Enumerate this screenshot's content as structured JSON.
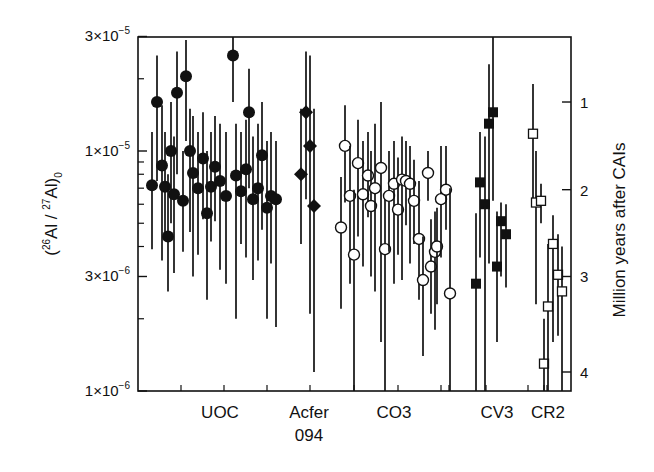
{
  "chart_data": {
    "type": "scatter",
    "title": "",
    "ylabel": "(26Al / 27Al)0",
    "ylabel_parts": {
      "open": "(",
      "sup1": "26",
      "mid": "Al / ",
      "sup2": "27",
      "end": "Al)",
      "sub": "0"
    },
    "y2label": "Million years after CAIs",
    "yscale": "log",
    "ylim": [
      1e-06,
      3e-05
    ],
    "y_ticks": [
      {
        "value": 3e-05,
        "label_base": "3×10",
        "label_exp": "−5"
      },
      {
        "value": 1e-05,
        "label_base": "1×10",
        "label_exp": "−5"
      },
      {
        "value": 3e-06,
        "label_base": "3×10",
        "label_exp": "−6"
      },
      {
        "value": 1e-06,
        "label_base": "1×10",
        "label_exp": "−6"
      }
    ],
    "y2_ticks": [
      {
        "label": "1",
        "value": 1.6e-05
      },
      {
        "label": "2",
        "value": 6.9e-06
      },
      {
        "label": "3",
        "value": 3e-06
      },
      {
        "label": "4",
        "value": 1.2e-06
      }
    ],
    "categories": [
      {
        "label": "UOC",
        "line2": ""
      },
      {
        "label": "Acfer",
        "line2": "094"
      },
      {
        "label": "CO3",
        "line2": ""
      },
      {
        "label": "CV3",
        "line2": ""
      },
      {
        "label": "CR2",
        "line2": ""
      }
    ],
    "grid": false,
    "legend": "none",
    "series": [
      {
        "name": "UOC",
        "marker": "filled-circle",
        "points": [
          {
            "x": 152,
            "y": 7.2e-06,
            "lo": 3.9e-06,
            "hi": 1.2e-05
          },
          {
            "x": 157,
            "y": 1.6e-05,
            "lo": 7.5e-06,
            "hi": 2.5e-05
          },
          {
            "x": 162,
            "y": 8.7e-06,
            "lo": 3.5e-06,
            "hi": 1.55e-05
          },
          {
            "x": 165,
            "y": 7.1e-06,
            "lo": 4.3e-06,
            "hi": 1.2e-05
          },
          {
            "x": 168,
            "y": 4.4e-06,
            "lo": 2.6e-06,
            "hi": 8e-06
          },
          {
            "x": 171,
            "y": 1e-05,
            "lo": 5e-06,
            "hi": 1.6e-05
          },
          {
            "x": 174,
            "y": 6.6e-06,
            "lo": 3.1e-06,
            "hi": 1.15e-05
          },
          {
            "x": 177,
            "y": 1.75e-05,
            "lo": 8e-06,
            "hi": 2.6e-05
          },
          {
            "x": 183,
            "y": 6.2e-06,
            "lo": 3.8e-06,
            "hi": 1e-05
          },
          {
            "x": 186,
            "y": 2.05e-05,
            "lo": 1.1e-05,
            "hi": 2.9e-05
          },
          {
            "x": 190,
            "y": 1e-05,
            "lo": 4.6e-06,
            "hi": 1.5e-05
          },
          {
            "x": 193,
            "y": 8.1e-06,
            "lo": 3e-06,
            "hi": 1.4e-05
          },
          {
            "x": 198,
            "y": 7e-06,
            "lo": 3.7e-06,
            "hi": 1.2e-05
          },
          {
            "x": 203,
            "y": 9.3e-06,
            "lo": 5.2e-06,
            "hi": 1.45e-05
          },
          {
            "x": 207,
            "y": 5.5e-06,
            "lo": 2.4e-06,
            "hi": 1e-05
          },
          {
            "x": 211,
            "y": 7.1e-06,
            "lo": 4.2e-06,
            "hi": 1.2e-05
          },
          {
            "x": 215,
            "y": 8.6e-06,
            "lo": 5.1e-06,
            "hi": 1.4e-05
          },
          {
            "x": 220,
            "y": 7.5e-06,
            "lo": 3.2e-06,
            "hi": 1.3e-05
          },
          {
            "x": 233,
            "y": 2.5e-05,
            "lo": 1.6e-05,
            "hi": 3e-05
          },
          {
            "x": 226,
            "y": 6.5e-06,
            "lo": 2.8e-06,
            "hi": 1.2e-05
          },
          {
            "x": 236,
            "y": 7.9e-06,
            "lo": 2e-06,
            "hi": 1.3e-05
          },
          {
            "x": 241,
            "y": 6.8e-06,
            "lo": 4.1e-06,
            "hi": 1.2e-05
          },
          {
            "x": 246,
            "y": 8.4e-06,
            "lo": 3.6e-06,
            "hi": 1.35e-05
          },
          {
            "x": 249,
            "y": 1.45e-05,
            "lo": 7e-06,
            "hi": 2.2e-05
          },
          {
            "x": 253,
            "y": 6.3e-06,
            "lo": 2.9e-06,
            "hi": 1.15e-05
          },
          {
            "x": 258,
            "y": 7e-06,
            "lo": 3.5e-06,
            "hi": 1.3e-05
          },
          {
            "x": 262,
            "y": 9.6e-06,
            "lo": 4.7e-06,
            "hi": 1.6e-05
          },
          {
            "x": 267,
            "y": 5.8e-06,
            "lo": 2e-06,
            "hi": 1.1e-05
          },
          {
            "x": 271,
            "y": 6.5e-06,
            "lo": 3.4e-06,
            "hi": 1.2e-05
          },
          {
            "x": 276,
            "y": 6.3e-06,
            "lo": 1.85e-06,
            "hi": 1.1e-05
          }
        ]
      },
      {
        "name": "Acfer 094",
        "marker": "filled-diamond",
        "points": [
          {
            "x": 301,
            "y": 8e-06,
            "lo": 4.1e-06,
            "hi": 1.5e-05
          },
          {
            "x": 306,
            "y": 1.45e-05,
            "lo": 6.3e-06,
            "hi": 2.6e-05
          },
          {
            "x": 310,
            "y": 1.05e-05,
            "lo": 2.1e-06,
            "hi": 2.5e-05
          },
          {
            "x": 314,
            "y": 5.9e-06,
            "lo": 1.2e-06,
            "hi": 1.5e-05
          }
        ]
      },
      {
        "name": "CO3",
        "marker": "open-circle",
        "points": [
          {
            "x": 341,
            "y": 4.8e-06,
            "lo": 2.2e-06,
            "hi": 7.8e-06
          },
          {
            "x": 345,
            "y": 1.05e-05,
            "lo": 6.1e-06,
            "hi": 1.55e-05
          },
          {
            "x": 350,
            "y": 6.5e-06,
            "lo": 2.8e-06,
            "hi": 1.05e-05
          },
          {
            "x": 354,
            "y": 3.7e-06,
            "lo": 1e-06,
            "hi": 6.9e-06
          },
          {
            "x": 358,
            "y": 8.9e-06,
            "lo": 4.4e-06,
            "hi": 1.35e-05
          },
          {
            "x": 363,
            "y": 6.6e-06,
            "lo": 3.3e-06,
            "hi": 1.1e-05
          },
          {
            "x": 368,
            "y": 7.9e-06,
            "lo": 5.3e-06,
            "hi": 1.2e-05
          },
          {
            "x": 371,
            "y": 5.9e-06,
            "lo": 3e-06,
            "hi": 1e-05
          },
          {
            "x": 375,
            "y": 7e-06,
            "lo": 2.6e-06,
            "hi": 1.3e-05
          },
          {
            "x": 381,
            "y": 8.5e-06,
            "lo": 1.6e-06,
            "hi": 1.6e-05
          },
          {
            "x": 385,
            "y": 3.9e-06,
            "lo": 1e-06,
            "hi": 6.7e-06
          },
          {
            "x": 389,
            "y": 6.5e-06,
            "lo": 3.8e-06,
            "hi": 1e-05
          },
          {
            "x": 394,
            "y": 7.3e-06,
            "lo": 2.8e-06,
            "hi": 1.1e-05
          },
          {
            "x": 398,
            "y": 5.7e-06,
            "lo": 3.7e-06,
            "hi": 9.4e-06
          },
          {
            "x": 402,
            "y": 7.6e-06,
            "lo": 2.9e-06,
            "hi": 1.15e-05
          },
          {
            "x": 406,
            "y": 7.5e-06,
            "lo": 4.9e-06,
            "hi": 1.1e-05
          },
          {
            "x": 410,
            "y": 7.3e-06,
            "lo": 3.4e-06,
            "hi": 1.05e-05
          },
          {
            "x": 414,
            "y": 6.2e-06,
            "lo": 4.1e-06,
            "hi": 9.2e-06
          },
          {
            "x": 419,
            "y": 4.3e-06,
            "lo": 2.4e-06,
            "hi": 7.5e-06
          },
          {
            "x": 423,
            "y": 2.9e-06,
            "lo": 1.4e-06,
            "hi": 4.4e-06
          },
          {
            "x": 428,
            "y": 8.1e-06,
            "lo": 6.2e-06,
            "hi": 1e-05
          },
          {
            "x": 431,
            "y": 3.3e-06,
            "lo": 2.1e-06,
            "hi": 5.2e-06
          },
          {
            "x": 435,
            "y": 3.8e-06,
            "lo": 1.8e-06,
            "hi": 5.6e-06
          },
          {
            "x": 437,
            "y": 4e-06,
            "lo": 2.3e-06,
            "hi": 5.8e-06
          },
          {
            "x": 441,
            "y": 6.3e-06,
            "lo": 3.6e-06,
            "hi": 1.05e-05
          },
          {
            "x": 446,
            "y": 6.9e-06,
            "lo": 4.7e-06,
            "hi": 1.05e-05
          },
          {
            "x": 450,
            "y": 2.55e-06,
            "lo": 1e-06,
            "hi": 7e-06
          }
        ]
      },
      {
        "name": "CV3",
        "marker": "filled-square",
        "points": [
          {
            "x": 476,
            "y": 2.8e-06,
            "lo": 1e-06,
            "hi": 5.5e-06
          },
          {
            "x": 480,
            "y": 7.4e-06,
            "lo": 3.6e-06,
            "hi": 1.2e-05
          },
          {
            "x": 485,
            "y": 6e-06,
            "lo": 1e-06,
            "hi": 1.15e-05
          },
          {
            "x": 489,
            "y": 1.3e-05,
            "lo": 3.4e-06,
            "hi": 2.3e-05
          },
          {
            "x": 493,
            "y": 1.45e-05,
            "lo": 6.2e-06,
            "hi": 3e-05
          },
          {
            "x": 497,
            "y": 3.3e-06,
            "lo": 1.6e-06,
            "hi": 5.6e-06
          },
          {
            "x": 501,
            "y": 5.1e-06,
            "lo": 3e-06,
            "hi": 6.1e-06
          },
          {
            "x": 506,
            "y": 4.5e-06,
            "lo": 2.7e-06,
            "hi": 6e-06
          }
        ]
      },
      {
        "name": "CR2",
        "marker": "open-square",
        "points": [
          {
            "x": 533,
            "y": 1.18e-05,
            "lo": 6e-06,
            "hi": 1.9e-05
          },
          {
            "x": 536,
            "y": 6.1e-06,
            "lo": 2.3e-06,
            "hi": 1e-05
          },
          {
            "x": 541,
            "y": 6.2e-06,
            "lo": 5e-06,
            "hi": 7.3e-06
          },
          {
            "x": 544,
            "y": 1.3e-06,
            "lo": 1e-06,
            "hi": 2e-06
          },
          {
            "x": 548,
            "y": 2.25e-06,
            "lo": 1e-06,
            "hi": 4.1e-06
          },
          {
            "x": 553,
            "y": 4.1e-06,
            "lo": 1.6e-06,
            "hi": 5.4e-06
          },
          {
            "x": 558,
            "y": 3.05e-06,
            "lo": 1.7e-06,
            "hi": 4.5e-06
          },
          {
            "x": 562,
            "y": 2.6e-06,
            "lo": 1e-06,
            "hi": 4e-06
          }
        ]
      }
    ]
  },
  "layout": {
    "plot_left": 138,
    "plot_right": 571,
    "plot_top": 37,
    "plot_bottom": 391,
    "decade_px": 240,
    "ref_value": 1e-05,
    "ref_y": 151,
    "bottom_ticks_x": [
      181,
      224,
      267,
      310,
      354,
      398,
      441,
      449,
      486,
      528,
      544,
      547
    ],
    "minor_y_values": [
      2e-05,
      9e-06,
      8e-06,
      7e-06,
      6e-06,
      5e-06,
      4e-06,
      2e-06
    ],
    "category_x": [
      220,
      309,
      394,
      497,
      548
    ]
  }
}
